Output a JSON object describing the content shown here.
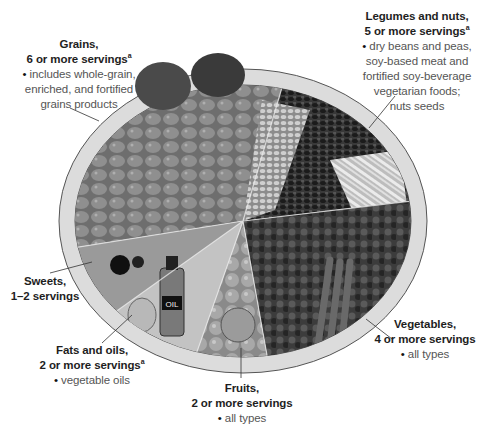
{
  "plate": {
    "center": {
      "x": 243,
      "y": 221
    },
    "outer_rx": 184,
    "outer_ry": 152,
    "rim_width": 16,
    "rim_color": "#d9d9d9",
    "outline_color": "#555555"
  },
  "groups": [
    {
      "id": "grains",
      "title_line1": "Grains,",
      "title_line2": "6 or more servings",
      "superscript": "a",
      "bullet_lines": [
        "includes whole-grain,",
        "enriched, and fortified",
        "grains products"
      ]
    },
    {
      "id": "legumes",
      "title_line1": "Legumes and nuts,",
      "title_line2": "5 or more servings",
      "superscript": "a",
      "bullet_lines": [
        "dry beans and peas,",
        "soy-based meat and",
        "fortified soy-beverage",
        "vegetarian foods;",
        "nuts seeds"
      ]
    },
    {
      "id": "sweets",
      "title_line1": "Sweets,",
      "title_line2": "1–2 servings",
      "superscript": "",
      "bullet_lines": []
    },
    {
      "id": "fats",
      "title_line1": "Fats and oils,",
      "title_line2": "2 or more servings",
      "superscript": "a",
      "bullet_lines": [
        "vegetable oils"
      ]
    },
    {
      "id": "fruits",
      "title_line1": "Fruits,",
      "title_line2": "2 or more servings",
      "superscript": "",
      "bullet_lines": [
        "all types"
      ]
    },
    {
      "id": "vegetables",
      "title_line1": "Vegetables,",
      "title_line2": "4 or more servings",
      "superscript": "",
      "bullet_lines": [
        "all types"
      ]
    }
  ],
  "oil_bottle_label": "OIL"
}
